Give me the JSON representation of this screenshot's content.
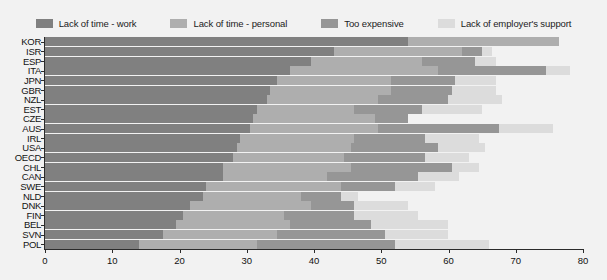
{
  "legend": {
    "items": [
      {
        "label": "Lack of time - work",
        "color": "#808080",
        "key": "work"
      },
      {
        "label": "Lack of time - personal",
        "color": "#aeaeae",
        "key": "personal"
      },
      {
        "label": "Too expensive",
        "color": "#969696",
        "key": "expensive"
      },
      {
        "label": "Lack of employer's support",
        "color": "#dcdcdc",
        "key": "support"
      }
    ]
  },
  "axis": {
    "x_ticks": [
      0,
      10,
      20,
      30,
      40,
      50,
      60,
      70,
      80
    ],
    "x_min": 0,
    "x_max": 80
  },
  "chart_data": {
    "type": "bar",
    "orientation": "horizontal",
    "stacked": true,
    "title": "",
    "xlabel": "",
    "ylabel": "",
    "xlim": [
      0,
      80
    ],
    "grid": false,
    "legend_position": "top",
    "categories": [
      "KOR",
      "ISR",
      "ESP",
      "ITA",
      "JPN",
      "GBR",
      "NZL",
      "EST",
      "CZE",
      "AUS",
      "IRL",
      "USA",
      "OECD",
      "CHL",
      "CAN",
      "SWE",
      "NLD",
      "DNK",
      "FIN",
      "BEL",
      "SVN",
      "POL"
    ],
    "series": [
      {
        "name": "Lack of time - work",
        "color": "#808080",
        "values": [
          54.0,
          43.0,
          39.5,
          36.5,
          34.5,
          33.5,
          33.0,
          31.5,
          31.0,
          30.5,
          29.0,
          28.5,
          28.0,
          26.5,
          26.5,
          24.0,
          23.5,
          21.5,
          20.5,
          19.5,
          17.5,
          14.0
        ]
      },
      {
        "name": "Lack of time - personal",
        "color": "#aeaeae",
        "values": [
          22.5,
          19.0,
          16.5,
          22.0,
          17.0,
          18.0,
          16.5,
          14.5,
          18.0,
          19.0,
          17.0,
          17.0,
          16.5,
          19.0,
          15.5,
          20.0,
          14.5,
          18.0,
          15.0,
          17.0,
          17.0,
          17.5
        ]
      },
      {
        "name": "Too expensive",
        "color": "#969696",
        "values": [
          0.0,
          3.0,
          8.0,
          16.0,
          9.5,
          9.0,
          10.5,
          10.0,
          5.0,
          18.0,
          10.5,
          13.0,
          12.0,
          15.0,
          13.5,
          8.0,
          6.0,
          6.5,
          10.5,
          12.0,
          16.0,
          20.5
        ]
      },
      {
        "name": "Lack of employer's support",
        "color": "#dcdcdc",
        "values": [
          0.0,
          1.5,
          3.0,
          3.5,
          6.0,
          6.5,
          8.0,
          9.0,
          0.0,
          8.0,
          8.0,
          7.0,
          6.5,
          4.0,
          6.0,
          6.0,
          2.5,
          8.0,
          9.5,
          11.5,
          9.5,
          14.0
        ]
      }
    ]
  }
}
